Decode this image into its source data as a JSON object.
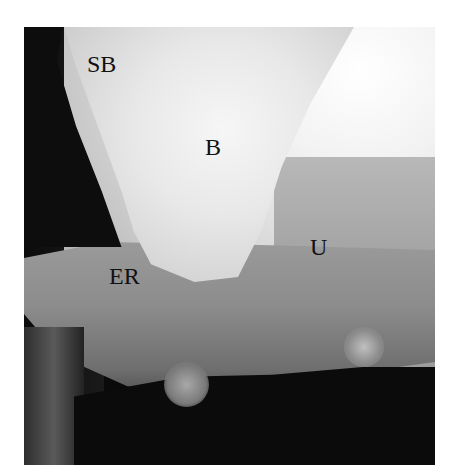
{
  "figure": {
    "type": "radiograph",
    "labels": [
      {
        "id": "sb",
        "text": "SB"
      },
      {
        "id": "b",
        "text": "B"
      },
      {
        "id": "u",
        "text": "U"
      },
      {
        "id": "er",
        "text": "ER"
      }
    ]
  }
}
